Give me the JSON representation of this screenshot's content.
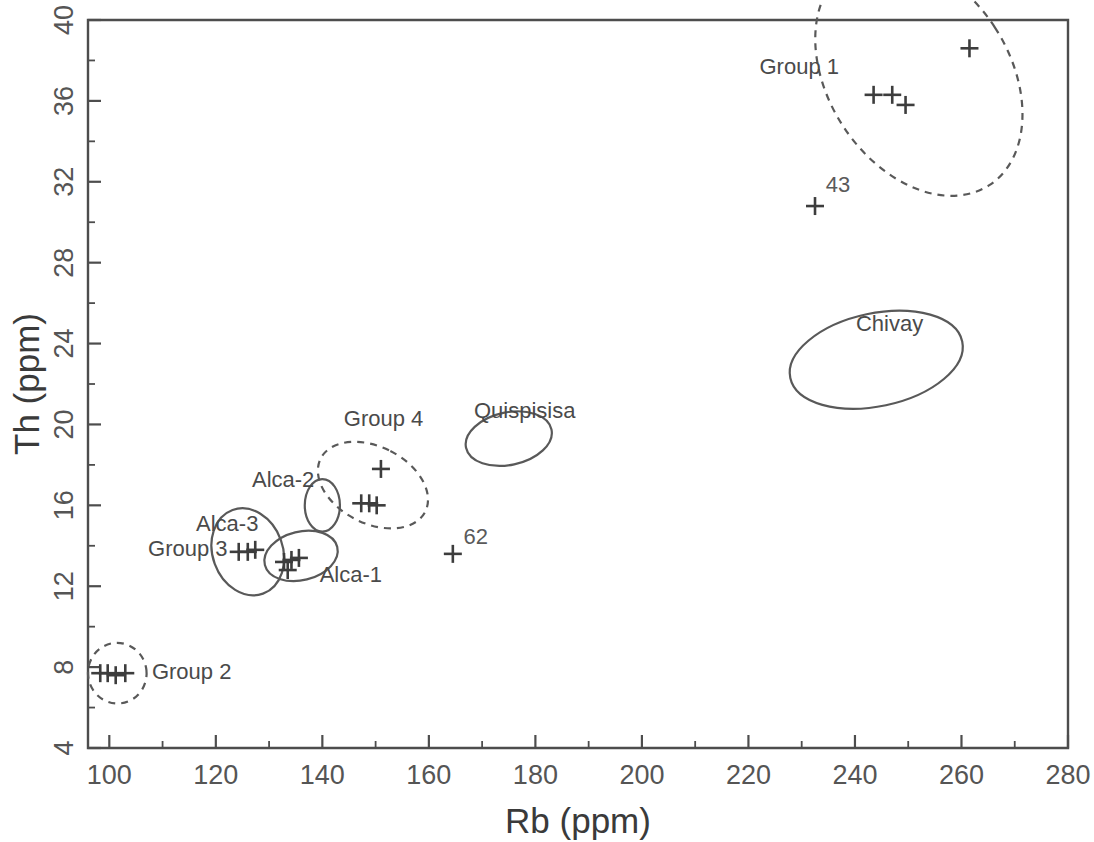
{
  "chart_data": {
    "type": "scatter",
    "title": "",
    "xlabel": "Rb (ppm)",
    "ylabel": "Th (ppm)",
    "xlim": [
      96,
      280
    ],
    "ylim": [
      4,
      40
    ],
    "x_ticks": [
      100,
      120,
      140,
      160,
      180,
      200,
      220,
      240,
      260,
      280
    ],
    "y_ticks": [
      4,
      8,
      12,
      16,
      20,
      24,
      28,
      32,
      36,
      40
    ],
    "x_minor_step": 10,
    "y_minor_step": 2,
    "grid": false,
    "legend": "none",
    "marker_style": "plus",
    "points": [
      {
        "x": 261.5,
        "y": 38.6,
        "group": "Group 1",
        "label": ""
      },
      {
        "x": 243.5,
        "y": 36.3,
        "group": "Group 1",
        "label": ""
      },
      {
        "x": 247.0,
        "y": 36.3,
        "group": "Group 1",
        "label": ""
      },
      {
        "x": 249.5,
        "y": 35.8,
        "group": "Group 1",
        "label": ""
      },
      {
        "x": 232.5,
        "y": 30.8,
        "group": "",
        "label": "43"
      },
      {
        "x": 164.5,
        "y": 13.6,
        "group": "",
        "label": "62"
      },
      {
        "x": 151.0,
        "y": 17.8,
        "group": "Group 4",
        "label": ""
      },
      {
        "x": 147.3,
        "y": 16.1,
        "group": "Group 4",
        "label": ""
      },
      {
        "x": 148.8,
        "y": 16.1,
        "group": "Group 4",
        "label": ""
      },
      {
        "x": 150.2,
        "y": 16.0,
        "group": "Group 4",
        "label": ""
      },
      {
        "x": 132.8,
        "y": 13.2,
        "group": "Alca-1",
        "label": ""
      },
      {
        "x": 134.2,
        "y": 13.3,
        "group": "Alca-1",
        "label": ""
      },
      {
        "x": 135.6,
        "y": 13.4,
        "group": "Alca-1",
        "label": ""
      },
      {
        "x": 133.5,
        "y": 12.8,
        "group": "Alca-1",
        "label": ""
      },
      {
        "x": 124.3,
        "y": 13.7,
        "group": "Group 3",
        "label": ""
      },
      {
        "x": 126.0,
        "y": 13.7,
        "group": "Group 3",
        "label": ""
      },
      {
        "x": 127.4,
        "y": 13.8,
        "group": "Group 3",
        "label": ""
      },
      {
        "x": 98.3,
        "y": 7.7,
        "group": "Group 2",
        "label": ""
      },
      {
        "x": 99.7,
        "y": 7.7,
        "group": "Group 2",
        "label": ""
      },
      {
        "x": 101.2,
        "y": 7.6,
        "group": "Group 2",
        "label": ""
      },
      {
        "x": 103.0,
        "y": 7.7,
        "group": "Group 2",
        "label": ""
      }
    ],
    "ellipses": [
      {
        "name": "Group 1",
        "cx": 252.0,
        "cy": 37.2,
        "rx": 17.0,
        "ry": 6.4,
        "angle": -33,
        "style": "dashed"
      },
      {
        "name": "Chivay",
        "cx": 244.0,
        "cy": 23.2,
        "rx": 16.5,
        "ry": 2.3,
        "angle": -12,
        "style": "solid"
      },
      {
        "name": "Quispisisa",
        "cx": 175.0,
        "cy": 19.3,
        "rx": 8.2,
        "ry": 1.3,
        "angle": -12,
        "style": "solid"
      },
      {
        "name": "Group 4",
        "cx": 149.5,
        "cy": 17.0,
        "rx": 7.2,
        "ry": 2.9,
        "angle": -63,
        "style": "dashed"
      },
      {
        "name": "Alca-2",
        "cx": 140.0,
        "cy": 16.0,
        "rx": 3.3,
        "ry": 1.3,
        "angle": 0,
        "style": "solid"
      },
      {
        "name": "Alca-1",
        "cx": 136.0,
        "cy": 13.5,
        "rx": 7.0,
        "ry": 1.2,
        "angle": -14,
        "style": "solid"
      },
      {
        "name": "Group 3",
        "cx": 126.0,
        "cy": 13.7,
        "rx": 6.6,
        "ry": 2.2,
        "angle": -20,
        "style": "solid"
      },
      {
        "name": "Group 2",
        "cx": 101.5,
        "cy": 7.7,
        "rx": 5.5,
        "ry": 1.5,
        "angle": -6,
        "style": "dashed"
      }
    ],
    "annotations": [
      {
        "text": "Group 1",
        "x": 237.0,
        "y": 37.6,
        "anchor": "end"
      },
      {
        "text": "Chivay",
        "x": 246.5,
        "y": 24.9,
        "anchor": "middle"
      },
      {
        "text": "Quispisisa",
        "x": 178.0,
        "y": 20.6,
        "anchor": "middle"
      },
      {
        "text": "Group 4",
        "x": 151.5,
        "y": 20.2,
        "anchor": "middle"
      },
      {
        "text": "Alca-2",
        "x": 138.5,
        "y": 17.2,
        "anchor": "end"
      },
      {
        "text": "Alca-3",
        "x": 128.0,
        "y": 15.0,
        "anchor": "end"
      },
      {
        "text": "Group 3",
        "x": 122.2,
        "y": 13.8,
        "anchor": "end"
      },
      {
        "text": "Alca-1",
        "x": 139.5,
        "y": 12.5,
        "anchor": "start"
      },
      {
        "text": "Group 2",
        "x": 108.0,
        "y": 7.7,
        "anchor": "start"
      },
      {
        "text": "43",
        "x": 234.5,
        "y": 31.8,
        "anchor": "start"
      },
      {
        "text": "62",
        "x": 166.5,
        "y": 14.4,
        "anchor": "start"
      }
    ],
    "colors": {
      "axis": "#4d4d4d",
      "marker": "#3d3d3d",
      "ellipse": "#595959",
      "label": "#4a4a4a",
      "background": "#ffffff"
    }
  }
}
